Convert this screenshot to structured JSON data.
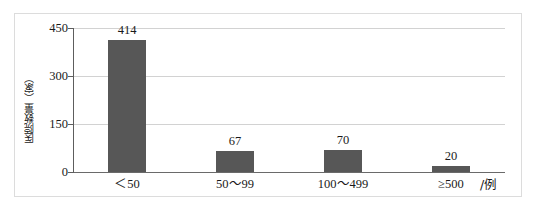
{
  "chart_data": {
    "type": "bar",
    "title": "",
    "xlabel": "/例",
    "ylabel": "医院数量（家）",
    "categories": [
      "＜50",
      "50～99",
      "100～499",
      "≥500"
    ],
    "values": [
      414,
      67,
      70,
      20
    ],
    "value_labels": [
      "414",
      "67",
      "70",
      "20"
    ],
    "ylim": [
      0,
      450
    ],
    "yticks": [
      0,
      150,
      300,
      450
    ],
    "ytick_labels": [
      "0",
      "150",
      "300",
      "450"
    ],
    "grid": "horizontal",
    "legend": "none",
    "bar_color": "#575757",
    "gridline_color": "#d2d2d2",
    "axis_color": "#5d5d5d",
    "border_color": "#dcdcdc",
    "background": "#ffffff"
  },
  "axis": {
    "y_title": "医院数量（家）",
    "x_unit": "/例",
    "ticks": {
      "t450": "450",
      "t300": "300",
      "t150": "150",
      "t0": "0"
    }
  },
  "bars": [
    {
      "category": "＜50",
      "value": 414,
      "label": "414"
    },
    {
      "category": "50～99",
      "value": 67,
      "label": "67"
    },
    {
      "category": "100～499",
      "value": 70,
      "label": "70"
    },
    {
      "category": "≥500",
      "value": 20,
      "label": "20"
    }
  ]
}
